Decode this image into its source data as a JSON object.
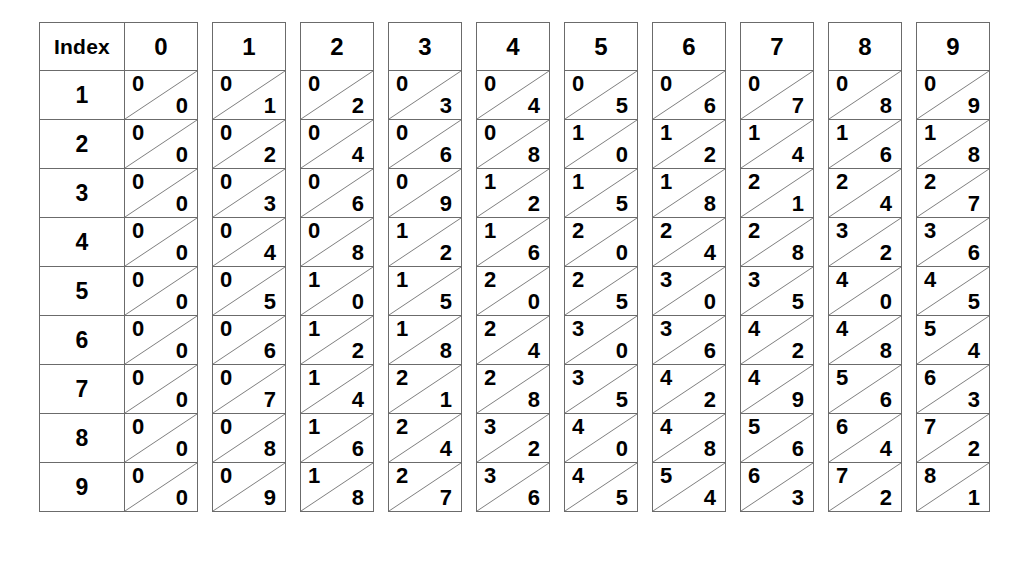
{
  "table": {
    "index_header_label": "Index",
    "column_headers": [
      "0",
      "1",
      "2",
      "3",
      "4",
      "5",
      "6",
      "7",
      "8",
      "9"
    ],
    "row_labels": [
      "1",
      "2",
      "3",
      "4",
      "5",
      "6",
      "7",
      "8",
      "9"
    ],
    "colors": {
      "border": "#6b6b6b",
      "diagonal": "#7a7a7a",
      "text": "#000000",
      "background": "#ffffff"
    },
    "rows": [
      {
        "index": "1",
        "cells": [
          {
            "tens": "0",
            "units": "0"
          },
          {
            "tens": "0",
            "units": "1"
          },
          {
            "tens": "0",
            "units": "2"
          },
          {
            "tens": "0",
            "units": "3"
          },
          {
            "tens": "0",
            "units": "4"
          },
          {
            "tens": "0",
            "units": "5"
          },
          {
            "tens": "0",
            "units": "6"
          },
          {
            "tens": "0",
            "units": "7"
          },
          {
            "tens": "0",
            "units": "8"
          },
          {
            "tens": "0",
            "units": "9"
          }
        ]
      },
      {
        "index": "2",
        "cells": [
          {
            "tens": "0",
            "units": "0"
          },
          {
            "tens": "0",
            "units": "2"
          },
          {
            "tens": "0",
            "units": "4"
          },
          {
            "tens": "0",
            "units": "6"
          },
          {
            "tens": "0",
            "units": "8"
          },
          {
            "tens": "1",
            "units": "0"
          },
          {
            "tens": "1",
            "units": "2"
          },
          {
            "tens": "1",
            "units": "4"
          },
          {
            "tens": "1",
            "units": "6"
          },
          {
            "tens": "1",
            "units": "8"
          }
        ]
      },
      {
        "index": "3",
        "cells": [
          {
            "tens": "0",
            "units": "0"
          },
          {
            "tens": "0",
            "units": "3"
          },
          {
            "tens": "0",
            "units": "6"
          },
          {
            "tens": "0",
            "units": "9"
          },
          {
            "tens": "1",
            "units": "2"
          },
          {
            "tens": "1",
            "units": "5"
          },
          {
            "tens": "1",
            "units": "8"
          },
          {
            "tens": "2",
            "units": "1"
          },
          {
            "tens": "2",
            "units": "4"
          },
          {
            "tens": "2",
            "units": "7"
          }
        ]
      },
      {
        "index": "4",
        "cells": [
          {
            "tens": "0",
            "units": "0"
          },
          {
            "tens": "0",
            "units": "4"
          },
          {
            "tens": "0",
            "units": "8"
          },
          {
            "tens": "1",
            "units": "2"
          },
          {
            "tens": "1",
            "units": "6"
          },
          {
            "tens": "2",
            "units": "0"
          },
          {
            "tens": "2",
            "units": "4"
          },
          {
            "tens": "2",
            "units": "8"
          },
          {
            "tens": "3",
            "units": "2"
          },
          {
            "tens": "3",
            "units": "6"
          }
        ]
      },
      {
        "index": "5",
        "cells": [
          {
            "tens": "0",
            "units": "0"
          },
          {
            "tens": "0",
            "units": "5"
          },
          {
            "tens": "1",
            "units": "0"
          },
          {
            "tens": "1",
            "units": "5"
          },
          {
            "tens": "2",
            "units": "0"
          },
          {
            "tens": "2",
            "units": "5"
          },
          {
            "tens": "3",
            "units": "0"
          },
          {
            "tens": "3",
            "units": "5"
          },
          {
            "tens": "4",
            "units": "0"
          },
          {
            "tens": "4",
            "units": "5"
          }
        ]
      },
      {
        "index": "6",
        "cells": [
          {
            "tens": "0",
            "units": "0"
          },
          {
            "tens": "0",
            "units": "6"
          },
          {
            "tens": "1",
            "units": "2"
          },
          {
            "tens": "1",
            "units": "8"
          },
          {
            "tens": "2",
            "units": "4"
          },
          {
            "tens": "3",
            "units": "0"
          },
          {
            "tens": "3",
            "units": "6"
          },
          {
            "tens": "4",
            "units": "2"
          },
          {
            "tens": "4",
            "units": "8"
          },
          {
            "tens": "5",
            "units": "4"
          }
        ]
      },
      {
        "index": "7",
        "cells": [
          {
            "tens": "0",
            "units": "0"
          },
          {
            "tens": "0",
            "units": "7"
          },
          {
            "tens": "1",
            "units": "4"
          },
          {
            "tens": "2",
            "units": "1"
          },
          {
            "tens": "2",
            "units": "8"
          },
          {
            "tens": "3",
            "units": "5"
          },
          {
            "tens": "4",
            "units": "2"
          },
          {
            "tens": "4",
            "units": "9"
          },
          {
            "tens": "5",
            "units": "6"
          },
          {
            "tens": "6",
            "units": "3"
          }
        ]
      },
      {
        "index": "8",
        "cells": [
          {
            "tens": "0",
            "units": "0"
          },
          {
            "tens": "0",
            "units": "8"
          },
          {
            "tens": "1",
            "units": "6"
          },
          {
            "tens": "2",
            "units": "4"
          },
          {
            "tens": "3",
            "units": "2"
          },
          {
            "tens": "4",
            "units": "0"
          },
          {
            "tens": "4",
            "units": "8"
          },
          {
            "tens": "5",
            "units": "6"
          },
          {
            "tens": "6",
            "units": "4"
          },
          {
            "tens": "7",
            "units": "2"
          }
        ]
      },
      {
        "index": "9",
        "cells": [
          {
            "tens": "0",
            "units": "0"
          },
          {
            "tens": "0",
            "units": "9"
          },
          {
            "tens": "1",
            "units": "8"
          },
          {
            "tens": "2",
            "units": "7"
          },
          {
            "tens": "3",
            "units": "6"
          },
          {
            "tens": "4",
            "units": "5"
          },
          {
            "tens": "5",
            "units": "4"
          },
          {
            "tens": "6",
            "units": "3"
          },
          {
            "tens": "7",
            "units": "2"
          },
          {
            "tens": "8",
            "units": "1"
          }
        ]
      }
    ]
  }
}
